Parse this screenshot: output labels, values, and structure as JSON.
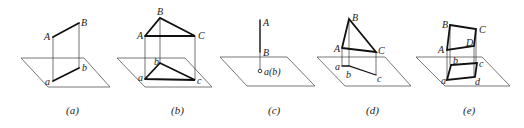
{
  "figures": [
    {
      "id": "a",
      "caption": "(a)",
      "labels": {
        "A": "A",
        "B": "B",
        "a": "a",
        "b": "b"
      }
    },
    {
      "id": "b",
      "caption": "(b)",
      "labels": {
        "A": "A",
        "B": "B",
        "C": "C",
        "a": "a",
        "b": "b",
        "c": "c"
      }
    },
    {
      "id": "c",
      "caption": "(c)",
      "labels": {
        "A": "A",
        "B": "B",
        "ab": "a(b)"
      }
    },
    {
      "id": "d",
      "caption": "(d)",
      "labels": {
        "A": "A",
        "B": "B",
        "C": "C",
        "a": "a",
        "b": "b",
        "c": "c"
      }
    },
    {
      "id": "e",
      "caption": "(e)",
      "labels": {
        "A": "A",
        "B": "B",
        "C": "C",
        "D": "D",
        "a": "a",
        "b": "b",
        "c": "c",
        "d": "d"
      }
    }
  ]
}
